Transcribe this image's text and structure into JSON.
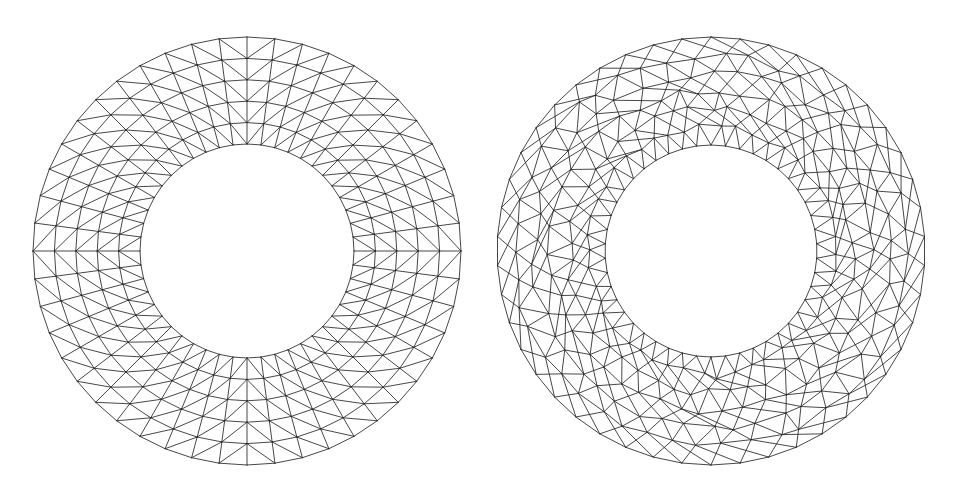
{
  "figure": {
    "background_color": "#ffffff",
    "width": 953,
    "height": 499,
    "line_color": "#262626",
    "line_width": 0.85
  },
  "panels": [
    {
      "id": "left-panel",
      "name": "structured-radial-annulus-mesh",
      "caption": "",
      "mesh_type": "structured",
      "shape": "annulus",
      "center_x": 247,
      "center_y": 251,
      "outer_radius": 214,
      "inner_radius": 107,
      "radial_layers": 6,
      "circumferential_divisions": 48,
      "diagonal_pattern": "mirrored-quadrant",
      "node_count": 336,
      "element_count": 576
    },
    {
      "id": "right-panel",
      "name": "unstructured-delaunay-annulus-mesh",
      "caption": "",
      "mesh_type": "unstructured",
      "shape": "annulus",
      "center_x": 711,
      "center_y": 251,
      "outer_radius": 214,
      "inner_radius": 106,
      "radial_layers": 7,
      "circumferential_divisions": 46,
      "diagonal_pattern": "irregular-delaunay",
      "node_count": 368,
      "element_count": 644
    }
  ],
  "chart_data": {
    "type": "diagram",
    "xlabel": "",
    "ylabel": "",
    "legend": [],
    "series": [
      {
        "name": "Structured radial annulus mesh (left)",
        "mesh_type": "structured",
        "center": [
          247,
          251
        ],
        "radii": [
          107,
          128.4,
          149.8,
          171.2,
          192.6,
          214
        ],
        "angular_steps": 48,
        "values": [
          6,
          48
        ]
      },
      {
        "name": "Unstructured Delaunay annulus mesh (right)",
        "mesh_type": "unstructured",
        "center": [
          711,
          251
        ],
        "radii": [
          106,
          121.4,
          136.8,
          152.2,
          167.6,
          183,
          198.4,
          214
        ],
        "angular_steps": 46,
        "values": [
          7,
          46
        ]
      }
    ]
  }
}
